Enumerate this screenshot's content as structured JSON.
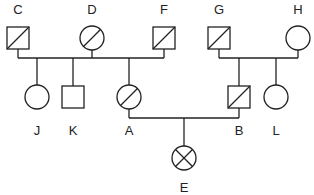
{
  "diagram": {
    "type": "pedigree",
    "colors": {
      "stroke": "#222222",
      "background": "#ffffff"
    },
    "individuals": [
      {
        "id": "C",
        "label": "C",
        "sex": "male",
        "marking": "slash",
        "cx": 18,
        "cy": 38,
        "labelY": 14
      },
      {
        "id": "D",
        "label": "D",
        "sex": "female",
        "marking": "slash",
        "cx": 92,
        "cy": 38,
        "labelY": 14
      },
      {
        "id": "F",
        "label": "F",
        "sex": "male",
        "marking": "slash",
        "cx": 164,
        "cy": 38,
        "labelY": 14
      },
      {
        "id": "G",
        "label": "G",
        "sex": "male",
        "marking": "slash",
        "cx": 219,
        "cy": 38,
        "labelY": 14
      },
      {
        "id": "H",
        "label": "H",
        "sex": "female",
        "marking": "none",
        "cx": 298,
        "cy": 38,
        "labelY": 14
      },
      {
        "id": "J",
        "label": "J",
        "sex": "female",
        "marking": "none",
        "cx": 37,
        "cy": 97,
        "labelY": 135
      },
      {
        "id": "K",
        "label": "K",
        "sex": "male",
        "marking": "none",
        "cx": 73,
        "cy": 97,
        "labelY": 135
      },
      {
        "id": "A",
        "label": "A",
        "sex": "female",
        "marking": "slash",
        "cx": 129,
        "cy": 97,
        "labelY": 135
      },
      {
        "id": "B",
        "label": "B",
        "sex": "male",
        "marking": "slash",
        "cx": 239,
        "cy": 97,
        "labelY": 135
      },
      {
        "id": "L",
        "label": "L",
        "sex": "female",
        "marking": "none",
        "cx": 276,
        "cy": 97,
        "labelY": 135
      },
      {
        "id": "E",
        "label": "E",
        "sex": "female",
        "marking": "cross",
        "cx": 184,
        "cy": 158,
        "labelY": 192
      }
    ],
    "lines": [
      {
        "note": "C down to mating line",
        "x1": 18,
        "y1": 49,
        "x2": 18,
        "y2": 58
      },
      {
        "note": "D down to mating line",
        "x1": 92,
        "y1": 50,
        "x2": 92,
        "y2": 58
      },
      {
        "note": "F down to mating line",
        "x1": 164,
        "y1": 49,
        "x2": 164,
        "y2": 58
      },
      {
        "note": "C-D-F mating line",
        "x1": 18,
        "y1": 58,
        "x2": 164,
        "y2": 58
      },
      {
        "note": "drop to J",
        "x1": 37,
        "y1": 58,
        "x2": 37,
        "y2": 85
      },
      {
        "note": "drop to K",
        "x1": 73,
        "y1": 58,
        "x2": 73,
        "y2": 86
      },
      {
        "note": "drop to A",
        "x1": 129,
        "y1": 58,
        "x2": 129,
        "y2": 85
      },
      {
        "note": "G down to mating line",
        "x1": 219,
        "y1": 49,
        "x2": 219,
        "y2": 58
      },
      {
        "note": "H down to mating line",
        "x1": 298,
        "y1": 50,
        "x2": 298,
        "y2": 58
      },
      {
        "note": "G-H mating line",
        "x1": 219,
        "y1": 58,
        "x2": 298,
        "y2": 58
      },
      {
        "note": "drop to B",
        "x1": 239,
        "y1": 58,
        "x2": 239,
        "y2": 86
      },
      {
        "note": "drop to L",
        "x1": 276,
        "y1": 58,
        "x2": 276,
        "y2": 85
      },
      {
        "note": "A down to mating line",
        "x1": 129,
        "y1": 109,
        "x2": 129,
        "y2": 118
      },
      {
        "note": "B down to mating line",
        "x1": 239,
        "y1": 108,
        "x2": 239,
        "y2": 118
      },
      {
        "note": "A-B mating line",
        "x1": 129,
        "y1": 118,
        "x2": 239,
        "y2": 118
      },
      {
        "note": "drop to E",
        "x1": 184,
        "y1": 118,
        "x2": 184,
        "y2": 146
      }
    ],
    "symbol_size": {
      "square_half": 11,
      "circle_r": 12
    }
  }
}
